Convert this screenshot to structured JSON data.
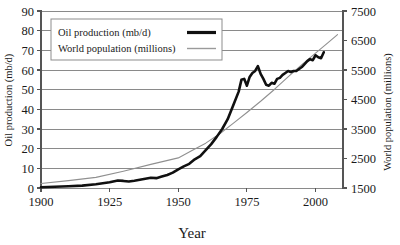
{
  "chart_data": {
    "type": "line",
    "title": "",
    "xlabel": "Year",
    "ylabel": "Oil production (mb/d)",
    "y2label": "World population (millions)",
    "xlim": [
      1900,
      2010
    ],
    "ylim": [
      0,
      90
    ],
    "y2lim": [
      1500,
      7500
    ],
    "grid": true,
    "legend_position": "top-left-inside",
    "xticks": [
      1900,
      1925,
      1950,
      1975,
      2000
    ],
    "xtick_labels": [
      "1900",
      "1925",
      "1950",
      "1975",
      "2000"
    ],
    "yticks": [
      0,
      10,
      20,
      30,
      40,
      50,
      60,
      70,
      80,
      90
    ],
    "ytick_labels": [
      "0",
      "10",
      "20",
      "30",
      "40",
      "50",
      "60",
      "70",
      "80",
      "90"
    ],
    "y2ticks": [
      1500,
      2500,
      3500,
      4500,
      5500,
      6500,
      7500
    ],
    "y2tick_labels": [
      "1500",
      "2500",
      "3500",
      "4500",
      "5500",
      "6500",
      "7500"
    ],
    "series": [
      {
        "name": "Oil production (mb/d)",
        "axis": "left",
        "color": "#101010",
        "style": "thick-solid",
        "x": [
          1900,
          1905,
          1910,
          1915,
          1920,
          1925,
          1928,
          1930,
          1932,
          1934,
          1936,
          1938,
          1940,
          1942,
          1944,
          1946,
          1948,
          1950,
          1952,
          1954,
          1956,
          1958,
          1960,
          1962,
          1964,
          1966,
          1968,
          1970,
          1972,
          1973,
          1974,
          1975,
          1976,
          1977,
          1978,
          1979,
          1980,
          1981,
          1982,
          1983,
          1984,
          1985,
          1986,
          1987,
          1988,
          1989,
          1990,
          1991,
          1992,
          1993,
          1994,
          1995,
          1996,
          1997,
          1998,
          1999,
          2000,
          2001,
          2002,
          2003
        ],
        "y": [
          0.4,
          0.6,
          0.9,
          1.2,
          1.9,
          2.9,
          3.8,
          3.6,
          3.3,
          3.7,
          4.2,
          4.7,
          5.2,
          5.0,
          5.8,
          6.6,
          7.8,
          9.5,
          11.0,
          12.3,
          14.6,
          16.2,
          19.3,
          22.3,
          26.0,
          30.0,
          35.0,
          42.0,
          49.0,
          55.0,
          55.5,
          52.0,
          56.5,
          58.5,
          59.5,
          62.0,
          58.0,
          55.5,
          52.5,
          52.0,
          53.5,
          53.0,
          55.5,
          56.0,
          57.5,
          58.5,
          59.5,
          59.0,
          59.5,
          59.5,
          60.5,
          61.5,
          63.0,
          64.5,
          65.5,
          65.0,
          67.5,
          66.5,
          66.0,
          69.0
        ]
      },
      {
        "name": "World population (millions)",
        "axis": "right",
        "color": "#909090",
        "style": "thin-solid",
        "x": [
          1900,
          1910,
          1920,
          1930,
          1940,
          1950,
          1955,
          1960,
          1965,
          1970,
          1975,
          1980,
          1985,
          1990,
          1995,
          2000,
          2005,
          2008
        ],
        "y": [
          1650,
          1750,
          1860,
          2070,
          2300,
          2520,
          2770,
          3020,
          3330,
          3690,
          4060,
          4440,
          4840,
          5270,
          5680,
          6070,
          6460,
          6700
        ]
      }
    ]
  },
  "legend": {
    "entries": [
      {
        "label": "Oil production (mb/d)",
        "swatch": "thick-black-line"
      },
      {
        "label": "World population (millions)",
        "swatch": "thin-gray-line"
      }
    ]
  },
  "colors": {
    "oil_line": "#101010",
    "population_line": "#909090",
    "gridline": "#8a8a8a",
    "axis": "#555555",
    "background": "#ffffff",
    "text": "#1a1a1a"
  }
}
